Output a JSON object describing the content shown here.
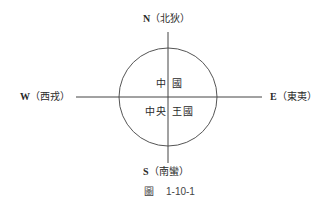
{
  "diagram": {
    "north": {
      "letter": "N",
      "name": "（北狄）"
    },
    "south": {
      "letter": "S",
      "name": "（南蠻）"
    },
    "west": {
      "letter": "W",
      "name": "（西戎）"
    },
    "east": {
      "letter": "E",
      "name": "（東夷）"
    },
    "center_top_left": "中",
    "center_top_right": "國",
    "center_bottom_left": "中央",
    "center_bottom_right": "王國",
    "line_color": "#555555"
  },
  "caption": {
    "prefix": "圖",
    "number": "1-10-1"
  }
}
